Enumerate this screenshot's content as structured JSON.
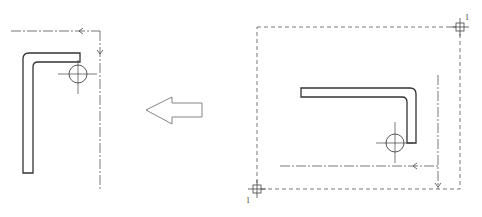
{
  "diagram": {
    "colors": {
      "stroke": "#3a3a3a",
      "centerline": "#555555",
      "background": "#ffffff"
    },
    "left_view": {
      "part": "L-shaped bent profile (vertical leg with top flange to the right)",
      "hole_marker": "circle with center cross",
      "centerlines": [
        "horizontal dash-dot top",
        "vertical dash-dot right"
      ],
      "arrows": [
        "left-pointing on horizontal line",
        "down-pointing on vertical line"
      ]
    },
    "transform_arrow": {
      "direction": "left",
      "style": "outlined hollow arrow"
    },
    "right_view": {
      "part": "L-shaped bent profile (horizontal leg with downward leg at right)",
      "hole_marker": "circle with center cross",
      "frame": "dashed bounding rectangle",
      "corner_markers": [
        {
          "position": "top-right",
          "label": "1"
        },
        {
          "position": "bottom-left",
          "label": "1"
        }
      ],
      "centerlines": [
        "horizontal dash-dot bottom",
        "vertical dash-dot right"
      ],
      "arrows": [
        "left-pointing on horizontal line",
        "down-pointing on vertical line"
      ]
    }
  }
}
